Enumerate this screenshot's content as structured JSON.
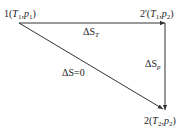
{
  "diagram": {
    "states": [
      {
        "id": "1",
        "label_prefix": "1(",
        "T": "T",
        "T_sub": "1",
        "p": "p",
        "p_sub": "1",
        "suffix": ")"
      },
      {
        "id": "2prime",
        "label_prefix": "2'(",
        "T": "T",
        "T_sub": "1",
        "p": "p",
        "p_sub": "2",
        "suffix": ")"
      },
      {
        "id": "2",
        "label_prefix": "2(",
        "T": "T",
        "T_sub": "2",
        "p": "p",
        "p_sub": "2",
        "suffix": ")"
      }
    ],
    "paths": [
      {
        "id": "isothermal",
        "from": "1",
        "to": "2prime",
        "label": "ΔS",
        "label_sub": "T"
      },
      {
        "id": "isobaric",
        "from": "2prime",
        "to": "2",
        "label": "ΔS",
        "label_sub": "p"
      },
      {
        "id": "isentropic",
        "from": "1",
        "to": "2",
        "label": "ΔS=0"
      }
    ],
    "colors": {
      "line": "#333333",
      "text": "#222222"
    }
  }
}
